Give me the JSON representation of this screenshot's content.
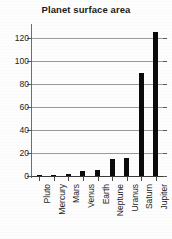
{
  "chart_data": {
    "type": "bar",
    "title": "Planet surface area",
    "xlabel": "",
    "ylabel": "",
    "categories": [
      "Pluto",
      "Mercury",
      "Mars",
      "Venus",
      "Earth",
      "Neptune",
      "Uranus",
      "Saturn",
      "Jupiter"
    ],
    "values": [
      0.2,
      0.7,
      1.4,
      4.6,
      5.1,
      15,
      16,
      89,
      125
    ],
    "ylim": [
      0,
      130
    ],
    "yticks": [
      0,
      20,
      40,
      60,
      80,
      100,
      120
    ],
    "ytick_labels": [
      "0",
      "20",
      "40",
      "60",
      "80",
      "100",
      "120"
    ],
    "grid": true,
    "legend": false,
    "bar_color": "#0b0b0b",
    "grid_color": "#9a9a9a",
    "axis_color": "#3a3a3a",
    "background_color": "#fdfdfd"
  }
}
